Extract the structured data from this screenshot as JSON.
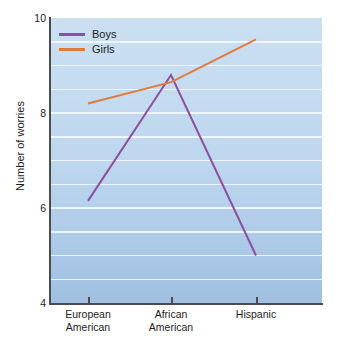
{
  "chart_data": {
    "type": "line",
    "title": "",
    "xlabel": "",
    "ylabel": "Number of worries",
    "categories": [
      "European American",
      "African American",
      "Hispanic"
    ],
    "category_lines": [
      [
        "European",
        "American"
      ],
      [
        "African",
        "American"
      ],
      [
        "Hispanic",
        ""
      ]
    ],
    "ylim": [
      4,
      10
    ],
    "yticks": [
      4,
      6,
      8,
      10
    ],
    "ytick_labels": [
      "4",
      "6",
      "8",
      "10"
    ],
    "gridlines": [
      9.5,
      9.0,
      8.5,
      8.0,
      7.5,
      7.0,
      6.5,
      6.0,
      5.5,
      5.0,
      4.5
    ],
    "grid": true,
    "legend_position": "top-left",
    "series": [
      {
        "name": "Boys",
        "color": "#8e4f9e",
        "values": [
          6.15,
          8.8,
          5.0
        ]
      },
      {
        "name": "Girls",
        "color": "#e07b3c",
        "values": [
          8.2,
          8.65,
          9.55
        ]
      }
    ]
  },
  "legend": {
    "items": [
      {
        "label": "Boys",
        "color": "#8e4f9e"
      },
      {
        "label": "Girls",
        "color": "#e07b3c"
      }
    ]
  },
  "colors": {
    "boys": "#8e4f9e",
    "girls": "#e07b3c",
    "plot_background_top": "#cbdff1",
    "plot_background_bottom": "#9fc0e2",
    "gridline": "#f2f7fc",
    "axis": "#4c4c4c"
  }
}
